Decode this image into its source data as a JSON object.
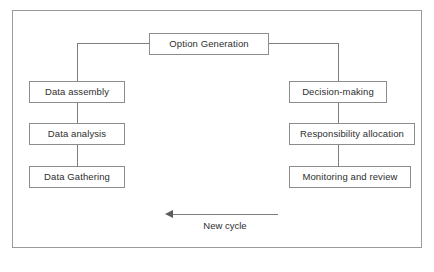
{
  "diagram": {
    "frame": {
      "name": "outer-border"
    },
    "nodes": [
      {
        "id": "option-generation",
        "label": "Option Generation",
        "x": 148,
        "y": 32,
        "w": 120,
        "h": 22
      },
      {
        "id": "data-assembly",
        "label": "Data assembly",
        "x": 28,
        "y": 80,
        "w": 96,
        "h": 22
      },
      {
        "id": "data-analysis",
        "label": "Data analysis",
        "x": 28,
        "y": 122,
        "w": 96,
        "h": 22
      },
      {
        "id": "data-gathering",
        "label": "Data Gathering",
        "x": 28,
        "y": 165,
        "w": 96,
        "h": 22
      },
      {
        "id": "decision-making",
        "label": "Decision-making",
        "x": 288,
        "y": 80,
        "w": 98,
        "h": 22
      },
      {
        "id": "responsibility-allocation",
        "label": "Responsibility allocation",
        "x": 288,
        "y": 122,
        "w": 126,
        "h": 22
      },
      {
        "id": "monitoring-and-review",
        "label": "Monitoring and review",
        "x": 288,
        "y": 165,
        "w": 122,
        "h": 22
      }
    ],
    "connectors": [
      {
        "id": "og-left-horizontal",
        "from": "option-generation",
        "to": "left-branch",
        "orient": "h"
      },
      {
        "id": "left-branch-vertical",
        "from": "left-branch",
        "to": "data-assembly",
        "orient": "v"
      },
      {
        "id": "assembly-to-analysis",
        "from": "data-assembly",
        "to": "data-analysis",
        "orient": "v"
      },
      {
        "id": "analysis-to-gathering",
        "from": "data-analysis",
        "to": "data-gathering",
        "orient": "v"
      },
      {
        "id": "og-right-horizontal",
        "from": "option-generation",
        "to": "right-branch",
        "orient": "h"
      },
      {
        "id": "right-branch-vertical",
        "from": "right-branch",
        "to": "decision-making",
        "orient": "v"
      },
      {
        "id": "decision-to-responsibility",
        "from": "decision-making",
        "to": "responsibility-allocation",
        "orient": "v"
      },
      {
        "id": "responsibility-to-monitoring",
        "from": "responsibility-allocation",
        "to": "monitoring-and-review",
        "orient": "v"
      }
    ],
    "cycle_arrow": {
      "label": "New cycle",
      "direction": "left"
    },
    "colors": {
      "frame_border": "#9a9a9a",
      "node_border": "#8c8c8c",
      "node_fill": "#ffffff",
      "connector": "#7d7d7d",
      "text": "#2e2e2e",
      "arrowhead": "#5d5d5d"
    }
  }
}
